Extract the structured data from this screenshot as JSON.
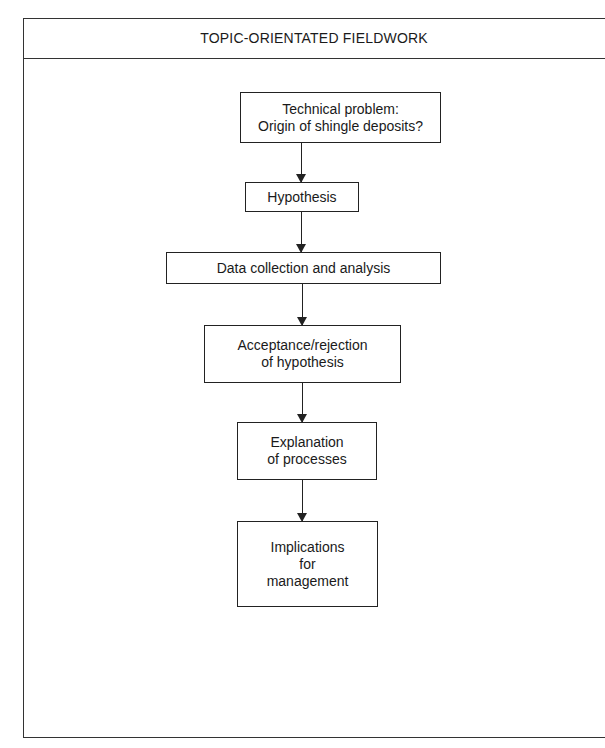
{
  "header": {
    "title": "TOPIC-ORIENTATED FIELDWORK"
  },
  "flow": {
    "steps": [
      {
        "lines": [
          "Technical problem:",
          "Origin of shingle deposits?"
        ]
      },
      {
        "lines": [
          "Hypothesis"
        ]
      },
      {
        "lines": [
          "Data collection and analysis"
        ]
      },
      {
        "lines": [
          "Acceptance/rejection",
          "of hypothesis"
        ]
      },
      {
        "lines": [
          "Explanation",
          "of processes"
        ]
      },
      {
        "lines": [
          "Implications",
          "for",
          "management"
        ]
      }
    ],
    "connectors": [
      "step1-to-step2",
      "step2-to-step3",
      "step3-to-step4",
      "step4-to-step5",
      "step5-to-step6"
    ]
  },
  "colors": {
    "line": "#222222",
    "background": "#ffffff"
  }
}
